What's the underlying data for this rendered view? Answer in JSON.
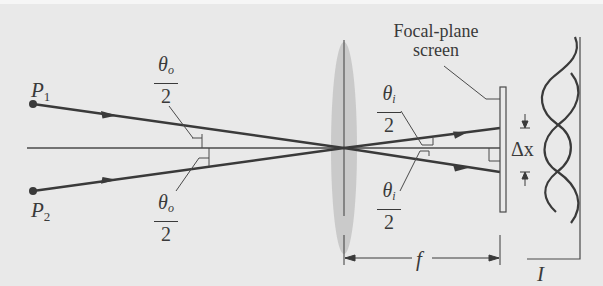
{
  "figure": {
    "colors": {
      "background": "#e9e9e9",
      "line": "#3a3a3a",
      "lens": "#c4c4c4"
    }
  },
  "points": {
    "p1": {
      "label": "P",
      "subscript": "1"
    },
    "p2": {
      "label": "P",
      "subscript": "2"
    }
  },
  "angles": {
    "object_upper": {
      "numerator": "θ",
      "subscript": "o",
      "denominator": "2"
    },
    "object_lower": {
      "numerator": "θ",
      "subscript": "o",
      "denominator": "2"
    },
    "image_upper": {
      "numerator": "θ",
      "subscript": "i",
      "denominator": "2"
    },
    "image_lower": {
      "numerator": "θ",
      "subscript": "i",
      "denominator": "2"
    }
  },
  "screen": {
    "label_line1": "Focal-plane",
    "label_line2": "screen"
  },
  "dimensions": {
    "separation": "Δx",
    "focal_length": "f",
    "intensity": "I"
  }
}
